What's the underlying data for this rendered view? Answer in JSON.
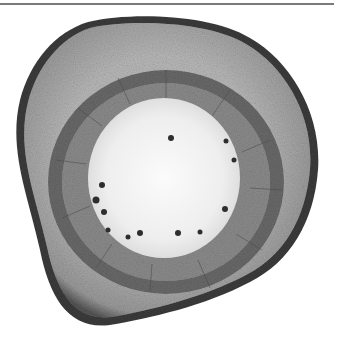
{
  "image": {
    "subject": "plant stem cross-section micrograph",
    "colors": {
      "background": "#ffffff",
      "cortex": "#9a9a9a",
      "epidermis": "#3a3a3a",
      "vascular_ring": "#6e6e6e",
      "pith": "#efefef",
      "rule": "#7a7a7a"
    }
  }
}
